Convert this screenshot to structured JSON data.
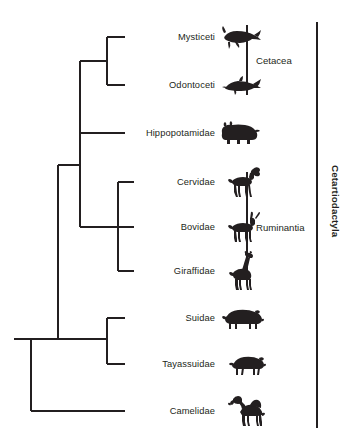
{
  "figure": {
    "type": "phylogenetic-cladogram",
    "background_color": "#ffffff",
    "line_color": "#231f20",
    "text_color": "#231f20"
  },
  "tips": [
    {
      "id": "mysticeti",
      "label": "Mysticeti",
      "icon": "baleen-whale-icon",
      "y": 37,
      "branch_x": 107
    },
    {
      "id": "odontoceti",
      "label": "Odontoceti",
      "icon": "dolphin-icon",
      "y": 85,
      "branch_x": 107
    },
    {
      "id": "hippopotamidae",
      "label": "Hippopotamidae",
      "icon": "hippopotamus-icon",
      "y": 133,
      "branch_x": 80
    },
    {
      "id": "cervidae",
      "label": "Cervidae",
      "icon": "deer-icon",
      "y": 182,
      "branch_x": 118
    },
    {
      "id": "bovidae",
      "label": "Bovidae",
      "icon": "antelope-icon",
      "y": 227,
      "branch_x": 118
    },
    {
      "id": "giraffidae",
      "label": "Giraffidae",
      "icon": "giraffe-icon",
      "y": 271,
      "branch_x": 118
    },
    {
      "id": "suidae",
      "label": "Suidae",
      "icon": "pig-icon",
      "y": 318,
      "branch_x": 107
    },
    {
      "id": "tayassuidae",
      "label": "Tayassuidae",
      "icon": "peccary-icon",
      "y": 364,
      "branch_x": 107
    },
    {
      "id": "camelidae",
      "label": "Camelidae",
      "icon": "camel-icon",
      "y": 411,
      "branch_x": 31
    }
  ],
  "clades": [
    {
      "id": "cetacea",
      "label": "Cetacea",
      "bar_x": 247,
      "bar_top": 25,
      "bar_bottom": 95,
      "label_x": 256,
      "label_y": 60,
      "bold": false
    },
    {
      "id": "ruminantia",
      "label": "Ruminantia",
      "bar_x": 247,
      "bar_top": 172,
      "bar_bottom": 282,
      "label_x": 256,
      "label_y": 227,
      "bold": false
    },
    {
      "id": "cetartiodactyla",
      "label": "Cetartiodactyla",
      "bar_x": 317,
      "bar_top": 22,
      "bar_bottom": 428,
      "label_x": 329,
      "label_y": 165,
      "bold": true
    }
  ],
  "tree_nodes": [
    {
      "id": "root",
      "x": 31,
      "top": 339,
      "bottom": 411,
      "stub_from": 14,
      "stub_y": 339
    },
    {
      "id": "artiodactyl-node",
      "x": 58,
      "top": 165,
      "bottom": 339
    },
    {
      "id": "whippomorph-node",
      "x": 80,
      "top": 61,
      "bottom": 133
    },
    {
      "id": "cetacea-node",
      "x": 107,
      "top": 37,
      "bottom": 85
    },
    {
      "id": "ruminantia-node",
      "x": 118,
      "top": 182,
      "bottom": 271
    },
    {
      "id": "suina-node",
      "x": 107,
      "top": 318,
      "bottom": 364
    }
  ],
  "layout": {
    "label_right_edge": 215,
    "icon_left_edge": 218,
    "width": 352,
    "height": 441
  }
}
